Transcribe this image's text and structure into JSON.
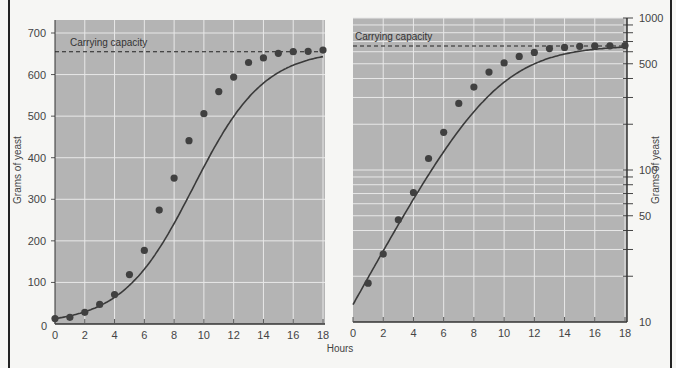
{
  "chart_data": [
    {
      "type": "scatter",
      "title": "",
      "scale": "linear",
      "xlabel": "Hours",
      "ylabel": "Grams of yeast",
      "xlim": [
        0,
        18
      ],
      "ylim": [
        0,
        700
      ],
      "x_ticks": [
        0,
        2,
        4,
        6,
        8,
        10,
        12,
        14,
        16,
        18
      ],
      "y_ticks": [
        0,
        100,
        200,
        300,
        400,
        500,
        600,
        700
      ],
      "grid": true,
      "annotation": "Carrying capacity",
      "carrying_capacity": 655,
      "series": [
        {
          "name": "Yeast growth (observed)",
          "x": [
            0,
            1,
            2,
            3,
            4,
            5,
            6,
            7,
            8,
            9,
            10,
            11,
            12,
            13,
            14,
            15,
            16,
            17,
            18
          ],
          "values": [
            13,
            16,
            28,
            47,
            71,
            119,
            177,
            274,
            351,
            441,
            506,
            559,
            594,
            629,
            640,
            651,
            655,
            656,
            659
          ]
        },
        {
          "name": "Logistic fit",
          "x": [
            0,
            1,
            2,
            3,
            4,
            5,
            6,
            7,
            8,
            9,
            10,
            11,
            12,
            13,
            14,
            15,
            16,
            17,
            18
          ],
          "values": [
            13,
            19,
            29,
            45,
            68,
            101,
            149,
            215,
            296,
            384,
            467,
            535,
            585,
            618,
            637,
            647,
            652,
            655,
            657
          ]
        }
      ]
    },
    {
      "type": "scatter",
      "title": "",
      "scale": "log",
      "xlabel": "Hours",
      "ylabel": "Grams of yeast",
      "xlim": [
        0,
        18
      ],
      "ylim": [
        10,
        1000
      ],
      "x_ticks": [
        0,
        2,
        4,
        6,
        8,
        10,
        12,
        14,
        16,
        18
      ],
      "y_ticks": [
        10,
        50,
        100,
        500,
        1000
      ],
      "grid": true,
      "y_axis_position": "right",
      "annotation": "Carrying capacity",
      "carrying_capacity": 655,
      "series": [
        {
          "name": "Yeast growth (observed)",
          "x": [
            1,
            2,
            3,
            4,
            5,
            6,
            7,
            8,
            9,
            10,
            11,
            12,
            13,
            14,
            15,
            16,
            17,
            18
          ],
          "values": [
            18,
            28,
            47,
            71,
            119,
            177,
            274,
            351,
            441,
            506,
            559,
            594,
            629,
            640,
            651,
            655,
            656,
            659
          ]
        },
        {
          "name": "Logistic fit",
          "x": [
            0,
            1,
            2,
            3,
            4,
            5,
            6,
            7,
            8,
            9,
            10,
            11,
            12,
            13,
            14,
            15,
            16,
            17,
            18
          ],
          "values": [
            13,
            19,
            29,
            45,
            68,
            101,
            149,
            215,
            296,
            384,
            467,
            535,
            585,
            618,
            637,
            647,
            652,
            655,
            657
          ]
        }
      ]
    }
  ],
  "labels": {
    "x_axis": "Hours",
    "y_axis_left": "Grams of yeast",
    "y_axis_right": "Grams of yeast",
    "cap_left": "Carrying capacity",
    "cap_right": "Carrying capacity"
  },
  "colors": {
    "page_bg": "#f6f6f4",
    "plot_bg": "#b4b4b4",
    "grid": "#e8e8e8",
    "curve": "#3a3a3a",
    "point": "#404040",
    "frame": "#222222"
  }
}
